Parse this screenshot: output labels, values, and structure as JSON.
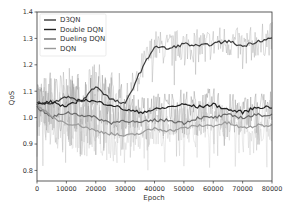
{
  "chart_data": {
    "type": "line",
    "title": "",
    "xlabel": "Epoch",
    "ylabel": "QoS",
    "xlim": [
      0,
      80000
    ],
    "ylim": [
      0.76,
      1.4
    ],
    "xticks": [
      0,
      10000,
      20000,
      30000,
      40000,
      50000,
      60000,
      70000,
      80000
    ],
    "xtick_labels": [
      "0",
      "10000",
      "20000",
      "30000",
      "40000",
      "50000",
      "60000",
      "70000",
      "80000"
    ],
    "yticks": [
      0.8,
      0.9,
      1.0,
      1.1,
      1.2,
      1.3,
      1.4
    ],
    "ytick_labels": [
      "0.8",
      "0.9",
      "1.0",
      "1.1",
      "1.2",
      "1.3",
      "1.4"
    ],
    "grid": false,
    "legend_position": "upper left",
    "x": [
      0,
      5000,
      10000,
      15000,
      20000,
      25000,
      30000,
      35000,
      40000,
      45000,
      50000,
      55000,
      60000,
      65000,
      70000,
      75000,
      80000
    ],
    "series": [
      {
        "name": "D3QN",
        "color": "#3a3a3a",
        "values": [
          1.06,
          1.05,
          1.08,
          1.06,
          1.12,
          1.07,
          1.05,
          1.17,
          1.27,
          1.26,
          1.28,
          1.27,
          1.28,
          1.29,
          1.27,
          1.29,
          1.3
        ]
      },
      {
        "name": "Double DQN",
        "color": "#222222",
        "values": [
          1.05,
          1.06,
          1.04,
          1.07,
          1.06,
          1.05,
          1.03,
          1.02,
          1.03,
          1.04,
          1.05,
          1.04,
          1.05,
          1.03,
          1.02,
          1.04,
          1.04
        ]
      },
      {
        "name": "Dueling DQN",
        "color": "#6a6a6a",
        "values": [
          1.04,
          1.0,
          1.02,
          1.01,
          1.0,
          0.98,
          0.99,
          0.98,
          0.99,
          0.99,
          0.98,
          1.0,
          1.0,
          1.01,
          1.0,
          1.01,
          1.01
        ]
      },
      {
        "name": "DQN",
        "color": "#9a9a9a",
        "values": [
          1.05,
          1.0,
          0.98,
          0.97,
          0.95,
          0.94,
          0.93,
          0.94,
          0.96,
          0.95,
          0.96,
          0.97,
          0.97,
          0.98,
          0.96,
          0.97,
          0.97
        ]
      }
    ],
    "noise_amplitude": 0.08
  }
}
